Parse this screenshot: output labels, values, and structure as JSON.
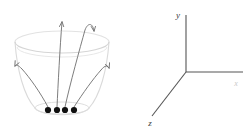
{
  "figure": {
    "background_color": "#ffffff",
    "panels": [
      {
        "id": "funnel-panel",
        "name": "funnel-with-trajectories"
      },
      {
        "id": "axes-panel",
        "name": "coordinate-axis-triad"
      }
    ]
  },
  "funnel": {
    "name": "funnel-bowl",
    "description": "Truncated cone / bowl seen in perspective with elliptical rim",
    "outline_color": "#dadada",
    "outline_width": 1.1,
    "rim_ellipse": {
      "cx": 62,
      "cy": 42,
      "rx": 47,
      "ry": 11
    },
    "base_ellipse": {
      "cx": 62,
      "cy": 108,
      "rx": 27,
      "ry": 6
    },
    "bottom_arc_color": "#dcdcdc"
  },
  "particles": {
    "name": "particle-dots",
    "count": 4,
    "color": "#101010",
    "radius": 3.1,
    "points": [
      {
        "x": 48,
        "y": 110
      },
      {
        "x": 57,
        "y": 110
      },
      {
        "x": 65,
        "y": 110
      },
      {
        "x": 74,
        "y": 110
      }
    ]
  },
  "trajectories": {
    "name": "trajectory-arrows",
    "color": "#6e6e6e",
    "width": 0.9,
    "count": 4,
    "arrows": [
      {
        "id": "trajectory-left-outer",
        "label": "escapes left over rim",
        "path": "M 48 107 C 40 92, 30 78, 22 69 C 18 65, 16 64, 15 66",
        "head_at": {
          "x": 15,
          "y": 66
        },
        "head_angle": -115
      },
      {
        "id": "trajectory-center-straight",
        "label": "rises vertically",
        "path": "M 57 107 C 58 86, 60 46, 62 22",
        "head_at": {
          "x": 62,
          "y": 22
        },
        "head_angle": -85
      },
      {
        "id": "trajectory-center-curving",
        "label": "rises then curls right",
        "path": "M 65 107 C 70 84, 80 48, 85 30 C 88 22, 93 23, 94 31",
        "head_at": {
          "x": 94,
          "y": 31
        },
        "head_angle": 80
      },
      {
        "id": "trajectory-right-outer",
        "label": "escapes right over rim",
        "path": "M 74 107 C 83 93, 93 79, 101 70 C 105 65, 108 65, 109 68",
        "head_at": {
          "x": 109,
          "y": 68
        },
        "head_angle": -62
      }
    ]
  },
  "axes": {
    "name": "coordinate-triad",
    "color": "#555555",
    "width": 1.1,
    "origin": {
      "x": 186,
      "y": 72
    },
    "items": [
      {
        "id": "axis-y",
        "label": "y",
        "direction": "up",
        "end": {
          "x": 186,
          "y": 15
        },
        "label_pos": {
          "x": 178,
          "y": 18
        },
        "faint": false
      },
      {
        "id": "axis-x",
        "label": "x",
        "direction": "right",
        "end": {
          "x": 243,
          "y": 72
        },
        "label_pos": {
          "x": 236,
          "y": 86
        },
        "faint": true
      },
      {
        "id": "axis-z",
        "label": "z",
        "direction": "down-left",
        "end": {
          "x": 152,
          "y": 116
        },
        "label_pos": {
          "x": 150,
          "y": 126
        },
        "faint": false
      }
    ]
  }
}
